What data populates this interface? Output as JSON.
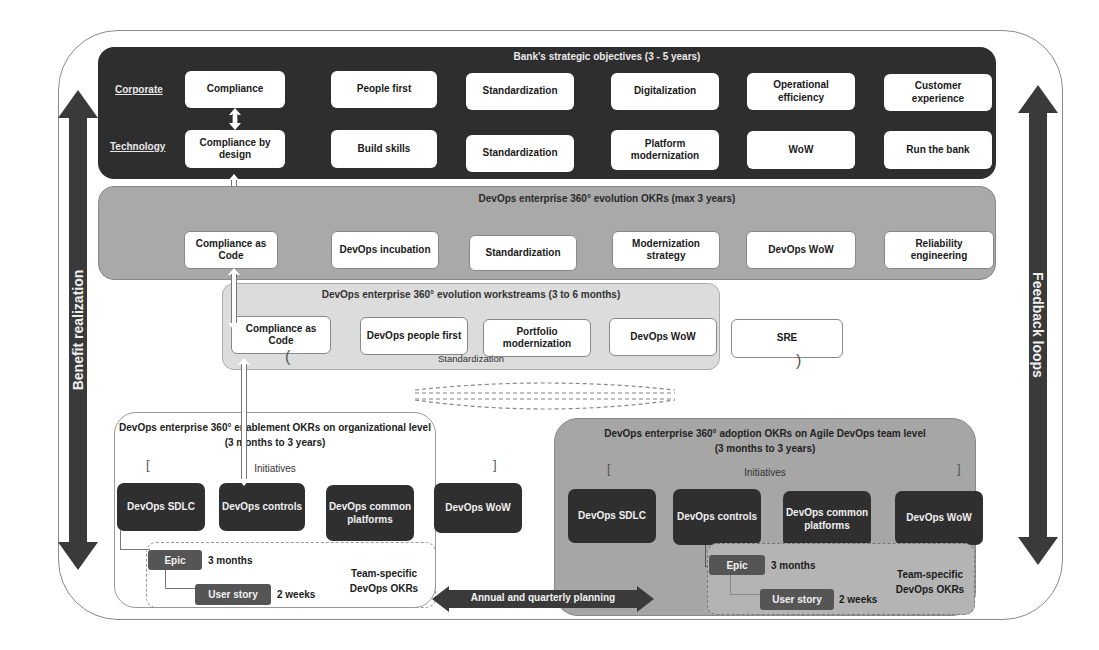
{
  "side_arrows": {
    "left": "Benefit realization",
    "right": "Feedback loops"
  },
  "tier1": {
    "title": "Bank's strategic objectives (3 - 5 years)",
    "row_labels": {
      "corporate": "Corporate",
      "technology": "Technology"
    },
    "corporate": [
      "Compliance",
      "People first",
      "Standardization",
      "Digitalization",
      "Operational efficiency",
      "Customer experience"
    ],
    "technology": [
      "Compliance by design",
      "Build skills",
      "Standardization",
      "Platform modernization",
      "WoW",
      "Run the bank"
    ]
  },
  "tier2": {
    "title": "DevOps enterprise 360° evolution OKRs (max 3 years)",
    "items": [
      "Compliance as Code",
      "DevOps incubation",
      "Standardization",
      "Modernization strategy",
      "DevOps WoW",
      "Reliability engineering"
    ]
  },
  "tier3": {
    "title": "DevOps enterprise 360° evolution workstreams (3 to 6 months)",
    "items": [
      "Compliance as Code",
      "DevOps people first",
      "Portfolio modernization",
      "DevOps WoW",
      "SRE"
    ],
    "group_label": "Standardization",
    "bracket_open": "(",
    "bracket_close": ")"
  },
  "enablement": {
    "title_line1": "DevOps enterprise 360° enablement OKRs on organizational level",
    "title_line2": "(3 months to 3 years)",
    "initiatives_label": "Initiatives",
    "bracket_open": "[",
    "bracket_close": "]",
    "initiatives": [
      "DevOps SDLC",
      "DevOps controls",
      "DevOps common platforms",
      "DevOps WoW"
    ],
    "epic": {
      "label": "Epic",
      "duration": "3 months"
    },
    "user_story": {
      "label": "User story",
      "duration": "2 weeks"
    },
    "team_okrs": "Team-specific DevOps OKRs"
  },
  "adoption": {
    "title_line1": "DevOps enterprise 360° adoption OKRs on Agile DevOps team level",
    "title_line2": "(3 months to 3 years)",
    "initiatives_label": "Initiatives",
    "bracket_open": "[",
    "bracket_close": "]",
    "initiatives": [
      "DevOps SDLC",
      "DevOps controls",
      "DevOps common platforms",
      "DevOps WoW"
    ],
    "epic": {
      "label": "Epic",
      "duration": "3 months"
    },
    "user_story": {
      "label": "User story",
      "duration": "2 weeks"
    },
    "team_okrs": "Team-specific DevOps OKRs"
  },
  "planning_arrow": {
    "label": "Annual and quarterly planning"
  },
  "colors": {
    "dark": "#2e2e2e",
    "mid_gray": "#a9a9a9",
    "light_gray": "#dcdcdc",
    "white": "#ffffff"
  }
}
